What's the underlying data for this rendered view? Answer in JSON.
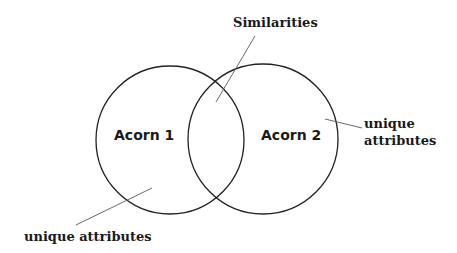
{
  "diagram": {
    "type": "venn",
    "sets": [
      {
        "id": "acorn1",
        "label": "Acorn 1",
        "cx": 170,
        "cy": 140,
        "r": 74
      },
      {
        "id": "acorn2",
        "label": "Acorn 2",
        "cx": 263,
        "cy": 139,
        "r": 75
      }
    ],
    "annotations": {
      "overlap": {
        "label": "Similarities"
      },
      "acorn2_unique": {
        "line1": "unique",
        "line2": "attributes"
      },
      "acorn1_unique": {
        "label": "unique attributes"
      }
    },
    "colors": {
      "stroke": "#222222",
      "leader": "#6a6a6a",
      "text": "#1a1a1a",
      "background": "#ffffff"
    }
  }
}
